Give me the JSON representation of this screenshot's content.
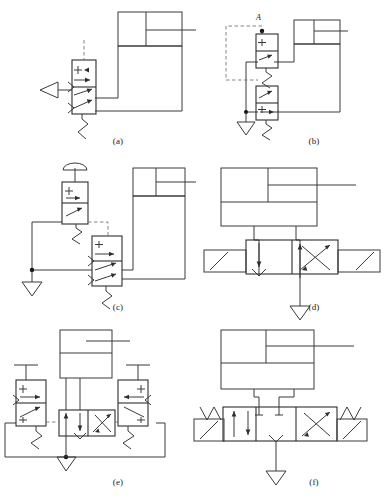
{
  "figure": {
    "type": "schematic-diagram-sheet",
    "panel_count": 6,
    "background_color": "#ffffff",
    "line_color": "#3a3a3a",
    "dashed_pilot_color": "#777777"
  },
  "panels": [
    {
      "id": "a",
      "caption": "(a)",
      "description": "Single-acting cylinder controlled by a lever-operated 3/2 spring-return valve",
      "components": [
        {
          "name": "cylinder",
          "kind": "double-chamber-cylinder-with-rod",
          "position": "top-right"
        },
        {
          "name": "valve",
          "kind": "4-port 2-position vertical valve",
          "cells": 2,
          "position": "center-left"
        },
        {
          "name": "actuator",
          "kind": "lever-triangle",
          "side": "left"
        },
        {
          "name": "spring",
          "kind": "zigzag-spring",
          "side": "bottom"
        },
        {
          "name": "pilot-line",
          "kind": "dashed-vertical",
          "side": "top"
        }
      ]
    },
    {
      "id": "b",
      "caption": "(b)",
      "description": "Two stacked 3/2 spring-return valves with pilot feedback loop, port A tapped at top",
      "port_label": "A",
      "components": [
        {
          "name": "cylinder",
          "kind": "double-chamber-cylinder-with-rod",
          "position": "top-right"
        },
        {
          "name": "upper-valve",
          "kind": "2-cell pilot valve",
          "cells": 2
        },
        {
          "name": "lower-valve",
          "kind": "2-cell pilot valve",
          "cells": 2
        },
        {
          "name": "pilot-loop",
          "kind": "dashed-rectangle-left"
        },
        {
          "name": "exhaust",
          "kind": "triangle-vent"
        }
      ]
    },
    {
      "id": "c",
      "caption": "(c)",
      "description": "Mushroom push-button 3/2 valve piloting a 4-port 2-position valve driving a cylinder",
      "components": [
        {
          "name": "cylinder",
          "kind": "double-chamber-cylinder-with-rod",
          "position": "top-right"
        },
        {
          "name": "button-valve",
          "kind": "mushroom-push-button valve",
          "cells": 2
        },
        {
          "name": "main-valve",
          "kind": "4-port 2-position valve",
          "cells": 2
        },
        {
          "name": "pilot-line",
          "kind": "dashed-horizontal"
        },
        {
          "name": "exhaust",
          "kind": "triangle-vent"
        },
        {
          "name": "junction",
          "kind": "tee-node"
        }
      ]
    },
    {
      "id": "d",
      "caption": "(d)",
      "description": "Double-acting cylinder with 4/2 directional valve, crossed-arrow position",
      "components": [
        {
          "name": "cylinder",
          "kind": "double-acting-cylinder-with-rod",
          "position": "top"
        },
        {
          "name": "valve",
          "kind": "4/2 directional valve horizontal",
          "cells": 2
        },
        {
          "name": "end-caps",
          "kind": "diagonal-actuator-boxes",
          "count": 2
        },
        {
          "name": "exhaust",
          "kind": "triangle-vent"
        }
      ]
    },
    {
      "id": "e",
      "caption": "(e)",
      "description": "Double-acting cylinder with centre 4/2 valve piloted by two roller-lever spring-return valves",
      "components": [
        {
          "name": "cylinder",
          "kind": "double-acting-cylinder-with-rod",
          "position": "top-center"
        },
        {
          "name": "left-valve",
          "kind": "roller-plunger 3/2 valve",
          "cells": 2
        },
        {
          "name": "right-valve",
          "kind": "roller-plunger 3/2 valve",
          "cells": 2
        },
        {
          "name": "centre-valve",
          "kind": "4/2 directional valve",
          "cells": 2
        },
        {
          "name": "pilot-line",
          "kind": "dashed-horizontal-both-sides"
        },
        {
          "name": "supply-loop",
          "kind": "rectangular-return-line"
        },
        {
          "name": "exhaust",
          "kind": "triangle-vent"
        }
      ]
    },
    {
      "id": "f",
      "caption": "(f)",
      "description": "Double-acting cylinder with spring-centred 4/3 directional valve",
      "components": [
        {
          "name": "cylinder",
          "kind": "double-acting-cylinder-with-rod",
          "position": "top"
        },
        {
          "name": "valve",
          "kind": "4/3 spring-centred directional valve",
          "cells": 3
        },
        {
          "name": "left-spring",
          "kind": "zigzag-spring"
        },
        {
          "name": "right-spring",
          "kind": "zigzag-spring"
        },
        {
          "name": "end-caps",
          "kind": "diagonal-actuator-boxes",
          "count": 2
        },
        {
          "name": "exhaust",
          "kind": "triangle-vent"
        }
      ]
    }
  ]
}
